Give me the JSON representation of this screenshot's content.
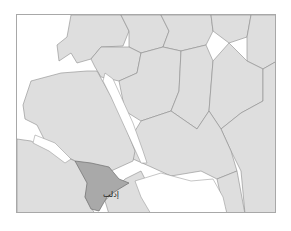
{
  "map": {
    "type": "administrative regions locator map",
    "highlight_label": "إدلب",
    "colors": {
      "land": "#dedede",
      "highlight": "#a9a9a9",
      "water": "#ffffff",
      "border": "#8c8c8c",
      "frame": "#a8a8a8"
    }
  }
}
